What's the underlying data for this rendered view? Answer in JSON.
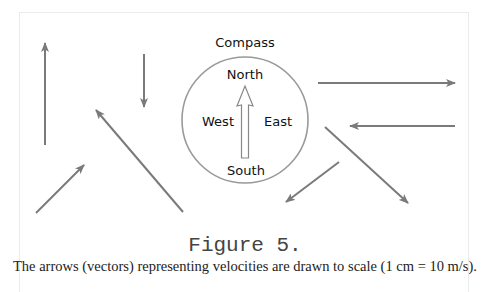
{
  "figure": {
    "title": "Figure 5.",
    "caption": "The arrows (vectors) representing velocities are drawn to scale (1 cm = 10 m/s)."
  },
  "compass": {
    "title": "Compass",
    "north": "North",
    "south": "South",
    "east": "East",
    "west": "West",
    "center": [
      245,
      120
    ],
    "radius": 63
  },
  "colors": {
    "arrow": "#7a7a7a",
    "circle": "#9a9a9a",
    "border": "#ececec",
    "text": "#111111"
  },
  "vectors": [
    {
      "id": "v1",
      "direction": "north",
      "from": [
        45,
        145
      ],
      "to": [
        45,
        43
      ]
    },
    {
      "id": "v2",
      "direction": "south",
      "from": [
        144,
        54
      ],
      "to": [
        144,
        107
      ]
    },
    {
      "id": "v3",
      "direction": "north-west",
      "from": [
        183,
        212
      ],
      "to": [
        96,
        110
      ]
    },
    {
      "id": "v4",
      "direction": "north-east",
      "from": [
        36,
        213
      ],
      "to": [
        84,
        165
      ]
    },
    {
      "id": "v5",
      "direction": "east",
      "from": [
        318,
        83
      ],
      "to": [
        455,
        83
      ]
    },
    {
      "id": "v6",
      "direction": "west",
      "from": [
        455,
        126
      ],
      "to": [
        350,
        126
      ]
    },
    {
      "id": "v7",
      "direction": "south-east",
      "from": [
        325,
        127
      ],
      "to": [
        408,
        203
      ]
    },
    {
      "id": "v8",
      "direction": "south-west",
      "from": [
        339,
        162
      ],
      "to": [
        286,
        202
      ]
    }
  ]
}
